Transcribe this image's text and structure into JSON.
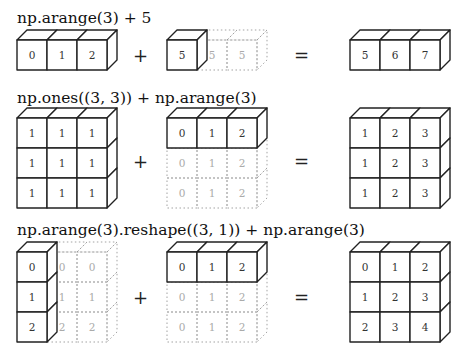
{
  "diagram": {
    "rows": [
      {
        "expression": "np.arange(3) + 5",
        "operator": "+",
        "equals": "=",
        "left": {
          "shape": [
            1,
            3
          ],
          "values": [
            [
              0,
              1,
              2
            ]
          ],
          "stretched": []
        },
        "right": {
          "shape": [
            1,
            1
          ],
          "values": [
            [
              5,
              5,
              5
            ]
          ],
          "solid_cells": [
            [
              0,
              0
            ]
          ]
        },
        "result": {
          "shape": [
            1,
            3
          ],
          "values": [
            [
              5,
              6,
              7
            ]
          ]
        }
      },
      {
        "expression": "np.ones((3, 3)) + np.arange(3)",
        "operator": "+",
        "equals": "=",
        "left": {
          "shape": [
            3,
            3
          ],
          "values": [
            [
              1,
              1,
              1
            ],
            [
              1,
              1,
              1
            ],
            [
              1,
              1,
              1
            ]
          ]
        },
        "right": {
          "shape": [
            1,
            3
          ],
          "values": [
            [
              0,
              1,
              2
            ],
            [
              0,
              1,
              2
            ],
            [
              0,
              1,
              2
            ]
          ],
          "solid_rows": [
            0
          ]
        },
        "result": {
          "shape": [
            3,
            3
          ],
          "values": [
            [
              1,
              2,
              3
            ],
            [
              1,
              2,
              3
            ],
            [
              1,
              2,
              3
            ]
          ]
        }
      },
      {
        "expression": "np.arange(3).reshape((3, 1)) + np.arange(3)",
        "operator": "+",
        "equals": "=",
        "left": {
          "shape": [
            3,
            1
          ],
          "values": [
            [
              0,
              0,
              0
            ],
            [
              1,
              1,
              1
            ],
            [
              2,
              2,
              2
            ]
          ],
          "solid_cols": [
            0
          ]
        },
        "right": {
          "shape": [
            1,
            3
          ],
          "values": [
            [
              0,
              1,
              2
            ],
            [
              0,
              1,
              2
            ],
            [
              0,
              1,
              2
            ]
          ],
          "solid_rows": [
            0
          ]
        },
        "result": {
          "shape": [
            3,
            3
          ],
          "values": [
            [
              0,
              1,
              2
            ],
            [
              1,
              2,
              3
            ],
            [
              2,
              3,
              4
            ]
          ]
        }
      }
    ]
  }
}
